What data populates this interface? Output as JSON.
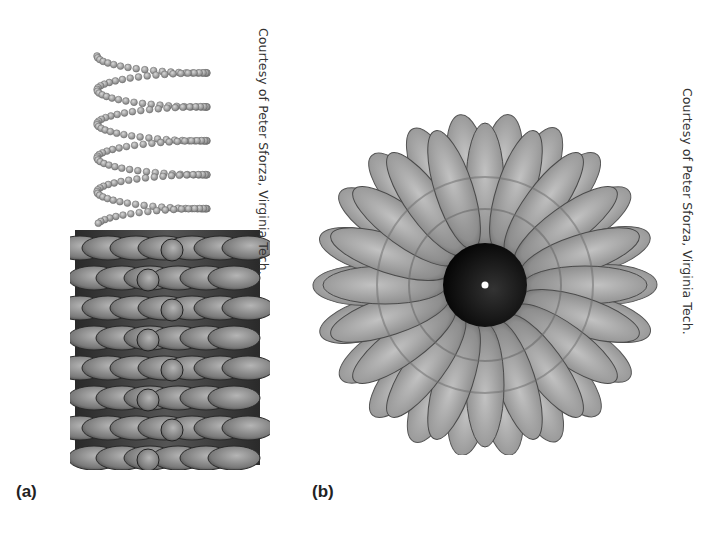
{
  "figure": {
    "panels": [
      {
        "label": "(a)",
        "credit": "Courtesy of Peter Sforza, Virginia Tech.",
        "description": "side view of helical structure: bead-chain helix above a stacked column of subunits"
      },
      {
        "label": "(b)",
        "credit": "Courtesy of Peter Sforza, Virginia Tech.",
        "description": "top-down view of rosette of radially arranged subunits around a dark central channel"
      }
    ],
    "colors": {
      "subunit": "#8a8a8a",
      "subunit_dark": "#3a3a3a",
      "helix_bead": "#9a9a9a",
      "core": "#111111"
    }
  }
}
